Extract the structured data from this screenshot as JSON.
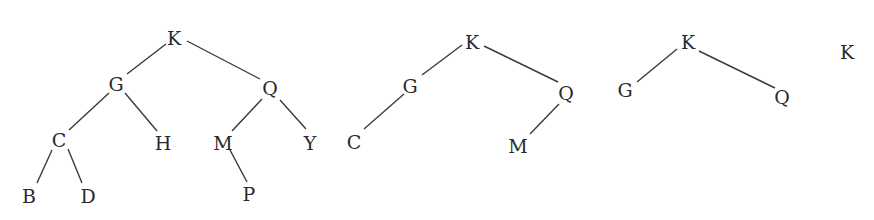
{
  "diagram": {
    "type": "binary-search-trees",
    "trees": [
      {
        "id": "tree-1",
        "nodes": [
          {
            "id": "K",
            "label": "K",
            "x": 174,
            "y": 38
          },
          {
            "id": "G",
            "label": "G",
            "x": 116,
            "y": 84
          },
          {
            "id": "Q",
            "label": "Q",
            "x": 270,
            "y": 88
          },
          {
            "id": "C",
            "label": "C",
            "x": 59,
            "y": 140
          },
          {
            "id": "H",
            "label": "H",
            "x": 163,
            "y": 143
          },
          {
            "id": "M",
            "label": "M",
            "x": 223,
            "y": 143
          },
          {
            "id": "Y",
            "label": "Y",
            "x": 310,
            "y": 143
          },
          {
            "id": "B",
            "label": "B",
            "x": 29,
            "y": 196
          },
          {
            "id": "D",
            "label": "D",
            "x": 88,
            "y": 196
          },
          {
            "id": "P",
            "label": "P",
            "x": 249,
            "y": 194
          }
        ],
        "edges": [
          {
            "from": "K",
            "to": "G",
            "x1": 166,
            "y1": 44,
            "x2": 127,
            "y2": 74
          },
          {
            "from": "K",
            "to": "Q",
            "x1": 187,
            "y1": 41,
            "x2": 260,
            "y2": 79
          },
          {
            "from": "G",
            "to": "C",
            "x1": 109,
            "y1": 93,
            "x2": 69,
            "y2": 130
          },
          {
            "from": "G",
            "to": "H",
            "x1": 125,
            "y1": 93,
            "x2": 157,
            "y2": 131
          },
          {
            "from": "Q",
            "to": "M",
            "x1": 262,
            "y1": 99,
            "x2": 232,
            "y2": 131
          },
          {
            "from": "Q",
            "to": "Y",
            "x1": 280,
            "y1": 100,
            "x2": 306,
            "y2": 129
          },
          {
            "from": "C",
            "to": "B",
            "x1": 52,
            "y1": 150,
            "x2": 37,
            "y2": 183
          },
          {
            "from": "C",
            "to": "D",
            "x1": 68,
            "y1": 149,
            "x2": 82,
            "y2": 183
          },
          {
            "from": "M",
            "to": "P",
            "x1": 230,
            "y1": 150,
            "x2": 247,
            "y2": 182
          }
        ]
      },
      {
        "id": "tree-2",
        "nodes": [
          {
            "id": "K",
            "label": "K",
            "x": 472,
            "y": 42
          },
          {
            "id": "G",
            "label": "G",
            "x": 410,
            "y": 86
          },
          {
            "id": "Q",
            "label": "Q",
            "x": 566,
            "y": 93
          },
          {
            "id": "C",
            "label": "C",
            "x": 354,
            "y": 142
          },
          {
            "id": "M",
            "label": "M",
            "x": 518,
            "y": 146
          }
        ],
        "edges": [
          {
            "from": "K",
            "to": "G",
            "x1": 462,
            "y1": 45,
            "x2": 422,
            "y2": 75
          },
          {
            "from": "K",
            "to": "Q",
            "x1": 484,
            "y1": 46,
            "x2": 558,
            "y2": 82
          },
          {
            "from": "G",
            "to": "C",
            "x1": 404,
            "y1": 94,
            "x2": 364,
            "y2": 129
          },
          {
            "from": "Q",
            "to": "M",
            "x1": 559,
            "y1": 104,
            "x2": 530,
            "y2": 134
          }
        ]
      },
      {
        "id": "tree-3",
        "nodes": [
          {
            "id": "K",
            "label": "K",
            "x": 688,
            "y": 42
          },
          {
            "id": "G",
            "label": "G",
            "x": 625,
            "y": 90
          },
          {
            "id": "Q",
            "label": "Q",
            "x": 782,
            "y": 97
          }
        ],
        "edges": [
          {
            "from": "K",
            "to": "G",
            "x1": 677,
            "y1": 49,
            "x2": 637,
            "y2": 82
          },
          {
            "from": "K",
            "to": "Q",
            "x1": 699,
            "y1": 51,
            "x2": 775,
            "y2": 88
          }
        ]
      },
      {
        "id": "tree-4",
        "nodes": [
          {
            "id": "K",
            "label": "K",
            "x": 847,
            "y": 52
          }
        ],
        "edges": []
      }
    ]
  }
}
